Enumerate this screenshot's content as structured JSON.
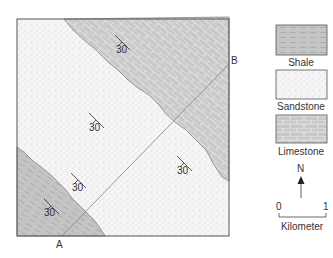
{
  "map": {
    "point_a": "A",
    "point_b": "B",
    "dips": [
      {
        "value": "30",
        "unit": "limestone"
      },
      {
        "value": "30",
        "unit": "sandstone"
      },
      {
        "value": "30",
        "unit": "sandstone"
      },
      {
        "value": "30",
        "unit": "sandstone"
      },
      {
        "value": "30",
        "unit": "shale"
      }
    ]
  },
  "legend": {
    "items": [
      {
        "label": "Shale",
        "icon": "shale-pattern"
      },
      {
        "label": "Sandstone",
        "icon": "sandstone-pattern"
      },
      {
        "label": "Limestone",
        "icon": "limestone-pattern"
      }
    ],
    "north": "N",
    "scale": {
      "start": "0",
      "end": "1",
      "unit": "Kilometer"
    }
  },
  "colors": {
    "shale_fill": "#c4c4c4",
    "limestone_fill": "#c8c8c8",
    "sandstone_fill": "#f4f4f4",
    "outline": "#555555"
  }
}
